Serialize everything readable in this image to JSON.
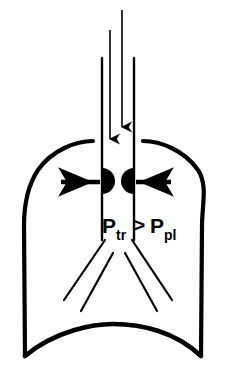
{
  "figure": {
    "caption_visible": false,
    "background_color": "#ffffff",
    "ink_color": "#000000"
  },
  "annotation": {
    "equation_plain": "Ptr > Ppl",
    "terms": [
      {
        "id": "p-tr",
        "base": "P",
        "subscript": "tr",
        "meaning_label": "P",
        "x": 104,
        "y": 232
      },
      {
        "id": "p-pl",
        "base": "P",
        "subscript": "pl",
        "x": 151,
        "y": 232
      }
    ],
    "operator": {
      "symbol": ">",
      "x": 136,
      "y": 231
    }
  },
  "flow_arrows": {
    "inspiratory": [
      {
        "id": "airflow-arrow-left",
        "x": 110,
        "y_start": 30,
        "y_end": 145,
        "direction": "down"
      },
      {
        "id": "airflow-arrow-center",
        "x": 122,
        "y_start": 10,
        "y_end": 133,
        "direction": "down"
      }
    ],
    "lateral": [
      {
        "id": "pressure-arrow-left",
        "y": 182,
        "x_start": 100,
        "x_end": 58,
        "direction": "left"
      },
      {
        "id": "pressure-arrow-right",
        "y": 182,
        "x_start": 136,
        "x_end": 174,
        "direction": "right"
      }
    ]
  },
  "airway": {
    "trachea_wall_left_x": 102,
    "trachea_wall_right_x": 134,
    "trachea_top_y": 58,
    "trachea_bottom_y": 238,
    "bulge_marker_left": {
      "id": "airway-bulge-left",
      "cx": 107,
      "cy": 181,
      "r": 13,
      "facing": "right"
    },
    "bulge_marker_right": {
      "id": "airway-bulge-right",
      "cx": 129,
      "cy": 181,
      "r": 13,
      "facing": "left"
    }
  },
  "thorax": {
    "outline_id": "thorax-outline",
    "apex_left_x": 93,
    "apex_right_x": 143,
    "apex_y": 140,
    "shoulder_left": {
      "x": 22,
      "y": 182
    },
    "shoulder_right": {
      "x": 204,
      "y": 182
    },
    "base_left": {
      "x": 25,
      "y": 356
    },
    "base_right": {
      "x": 201,
      "y": 356
    },
    "diaphragm_peak": {
      "x": 113,
      "y": 330
    }
  },
  "bronchi": [
    {
      "id": "bronchus-left-upper",
      "x1": 104,
      "y1": 240,
      "x2": 63,
      "y2": 300
    },
    {
      "id": "bronchus-left-lower",
      "x1": 112,
      "y1": 254,
      "x2": 80,
      "y2": 310
    },
    {
      "id": "bronchus-right-upper",
      "x1": 133,
      "y1": 240,
      "x2": 173,
      "y2": 300
    },
    {
      "id": "bronchus-right-lower",
      "x1": 126,
      "y1": 254,
      "x2": 158,
      "y2": 310
    }
  ]
}
